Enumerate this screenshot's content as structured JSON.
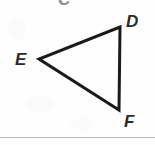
{
  "figure": {
    "type": "geometry-diagram",
    "shape": "triangle",
    "background_color": "#fefefe",
    "stroke_color": "#1a1a1a",
    "stroke_width": 3,
    "label_color": "#2b2b2b",
    "faded_label_color": "#8d8d8d",
    "divider_color": "#b9b9b9",
    "vertices": [
      {
        "name": "D",
        "x": 120,
        "y": 27
      },
      {
        "name": "E",
        "x": 39,
        "y": 59
      },
      {
        "name": "F",
        "x": 119,
        "y": 110
      }
    ],
    "edges": [
      {
        "name": "ED",
        "from": "E",
        "to": "D"
      },
      {
        "name": "DF",
        "from": "D",
        "to": "F"
      },
      {
        "name": "FE",
        "from": "F",
        "to": "E"
      }
    ],
    "labels": {
      "partial_top": "C",
      "top_right": "D",
      "left": "E",
      "bottom_right": "F"
    }
  }
}
